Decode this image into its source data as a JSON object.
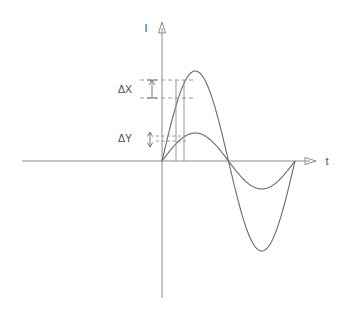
{
  "figure": {
    "name": "two-sine-waves-amplitude-comparison",
    "background_color": "#ffffff",
    "line_color": "#6b6b6b",
    "axis_color": "#8c8c8c",
    "text_color": "#4d4d4d"
  },
  "axes": {
    "y_axis_label": "I",
    "x_axis_label": "t",
    "origin": {
      "x": 162,
      "y": 161
    },
    "x_axis_start": 22,
    "x_axis_end": 316,
    "y_axis_top": 22,
    "y_axis_bottom": 298
  },
  "annotations": [
    {
      "label": "ΔX",
      "label_x": 118,
      "label_y": 93,
      "arrow_x": 152,
      "arrow_top_y": 80,
      "arrow_bottom_y": 98,
      "dash_upper_y": 80,
      "dash_lower_y": 98,
      "dash_x_start": 140,
      "dash_x_end": 196,
      "arrow_style": "up-arrow"
    },
    {
      "label": "ΔY",
      "label_x": 118,
      "label_y": 142,
      "arrow_x": 150,
      "arrow_top_y": 132,
      "arrow_bottom_y": 147,
      "dash_upper_y": 136,
      "dash_lower_y": 141,
      "dash_x_start": 156,
      "dash_x_end": 186,
      "arrow_style": "double-arrow"
    }
  ],
  "markers": {
    "vertical_line_1_x": 176,
    "vertical_line_2_x": 184,
    "vertical_line_top_y": 80,
    "vertical_line_bottom_y": 161
  },
  "chart_data": {
    "type": "line",
    "title": "",
    "xlabel": "t",
    "ylabel": "I",
    "grid": false,
    "legend": "none",
    "xlim": [
      0,
      1
    ],
    "ylim": [
      -1,
      1
    ],
    "x_zero_crossings_px": [
      162,
      228,
      295
    ],
    "series": [
      {
        "name": "large-amplitude-wave",
        "amplitude": 1.0,
        "period": 1.0,
        "phase": 0.0,
        "peak_value": 1.0,
        "peak_x": 0.25,
        "trough_value": -1.0,
        "trough_x": 0.75,
        "peak_px": {
          "x": 201,
          "y": 71
        },
        "trough_px": {
          "x": 262,
          "y": 247
        },
        "values": [
          0,
          0.31,
          0.59,
          0.81,
          0.95,
          1.0,
          0.95,
          0.81,
          0.59,
          0.31,
          0,
          -0.31,
          -0.59,
          -0.81,
          -0.95,
          -1.0,
          -0.95,
          -0.81,
          -0.59,
          -0.31,
          0
        ]
      },
      {
        "name": "small-amplitude-wave",
        "amplitude": 0.33,
        "period": 1.0,
        "phase": 0.0,
        "peak_value": 0.33,
        "peak_x": 0.25,
        "trough_value": -0.33,
        "trough_x": 0.75,
        "peak_px": {
          "x": 201,
          "y": 133
        },
        "trough_px": {
          "x": 262,
          "y": 190
        },
        "values": [
          0,
          0.1,
          0.19,
          0.27,
          0.31,
          0.33,
          0.31,
          0.27,
          0.19,
          0.1,
          0,
          -0.1,
          -0.19,
          -0.27,
          -0.31,
          -0.33,
          -0.31,
          -0.27,
          -0.19,
          -0.1,
          0
        ]
      }
    ],
    "x": [
      0,
      0.05,
      0.1,
      0.15,
      0.2,
      0.25,
      0.3,
      0.35,
      0.4,
      0.45,
      0.5,
      0.55,
      0.6,
      0.65,
      0.7,
      0.75,
      0.8,
      0.85,
      0.9,
      0.95,
      1.0
    ]
  }
}
